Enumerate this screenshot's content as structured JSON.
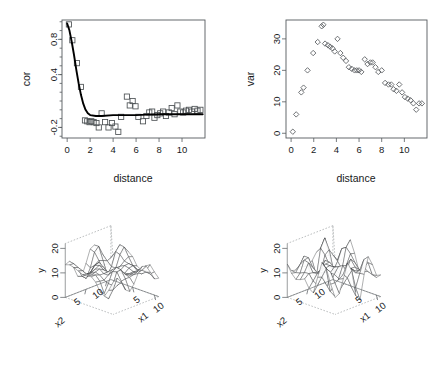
{
  "figure": {
    "layout": "2x2 panel grid",
    "background": "#ffffff",
    "foreground": "#17191b"
  },
  "chart_data": [
    {
      "panel": "top-left",
      "type": "scatter",
      "title": "",
      "xlabel": "distance",
      "ylabel": "cor",
      "xlim": [
        -0.45,
        12.0
      ],
      "ylim": [
        -0.32,
        1.02
      ],
      "xticks": [
        0,
        2,
        4,
        6,
        8,
        10
      ],
      "yticks": [
        -0.2,
        0.4,
        0.8
      ],
      "ytick_labels": [
        "-0.2",
        "0.4",
        "0.8"
      ],
      "grid": false,
      "marker": "open-square",
      "legend": "none",
      "series": [
        {
          "name": "empirical correlation",
          "x": [
            0.15,
            0.45,
            0.85,
            1.2,
            1.55,
            1.75,
            1.95,
            2.1,
            2.3,
            2.55,
            2.75,
            3.0,
            3.3,
            3.6,
            3.9,
            4.2,
            4.45,
            4.7,
            5.2,
            5.45,
            5.7,
            5.95,
            6.2,
            6.6,
            6.9,
            7.15,
            7.4,
            7.6,
            7.85,
            8.1,
            8.35,
            8.6,
            8.85,
            9.1,
            9.35,
            9.6,
            9.85,
            10.1,
            10.35,
            10.6,
            10.85,
            11.1,
            11.35,
            11.6
          ],
          "y": [
            0.97,
            0.79,
            0.53,
            0.26,
            -0.12,
            -0.13,
            -0.14,
            -0.13,
            -0.14,
            -0.15,
            -0.2,
            -0.04,
            -0.14,
            -0.2,
            -0.15,
            -0.19,
            -0.25,
            -0.08,
            0.15,
            0.05,
            0.1,
            0.04,
            -0.08,
            -0.13,
            -0.07,
            -0.03,
            -0.02,
            -0.09,
            -0.06,
            -0.04,
            -0.02,
            -0.07,
            -0.03,
            0.02,
            -0.05,
            0.05,
            -0.02,
            -0.03,
            -0.01,
            0.0,
            -0.02,
            0.01,
            -0.01,
            0.0
          ]
        }
      ],
      "fitted_curve": {
        "name": "fitted exponential decay",
        "style": "solid thick black line",
        "model": "exponential decay to near-zero sill",
        "x": [
          0.0,
          0.2,
          0.4,
          0.6,
          0.8,
          1.0,
          1.2,
          1.4,
          1.6,
          1.8,
          2.0,
          2.5,
          3.0,
          4.0,
          5.0,
          6.0,
          7.0,
          8.0,
          9.0,
          10.0,
          11.0,
          11.8
        ],
        "y": [
          0.98,
          0.9,
          0.77,
          0.62,
          0.45,
          0.3,
          0.17,
          0.07,
          0.0,
          -0.04,
          -0.06,
          -0.07,
          -0.07,
          -0.06,
          -0.06,
          -0.06,
          -0.055,
          -0.05,
          -0.05,
          -0.05,
          -0.05,
          -0.05
        ]
      }
    },
    {
      "panel": "top-right",
      "type": "scatter",
      "title": "",
      "xlabel": "distance",
      "ylabel": "var",
      "xlim": [
        -0.45,
        12.0
      ],
      "ylim": [
        -1.5,
        36.0
      ],
      "xticks": [
        0,
        2,
        4,
        6,
        8,
        10
      ],
      "yticks": [
        0,
        10,
        20,
        30
      ],
      "grid": false,
      "marker": "open-diamond",
      "legend": "none",
      "series": [
        {
          "name": "empirical semivariance",
          "x": [
            0.15,
            0.45,
            0.9,
            1.1,
            1.45,
            1.95,
            2.35,
            2.7,
            2.85,
            3.0,
            3.25,
            3.45,
            3.65,
            3.85,
            4.1,
            4.35,
            4.6,
            4.85,
            5.1,
            5.35,
            5.6,
            5.8,
            6.0,
            6.2,
            6.5,
            6.75,
            7.0,
            7.2,
            7.45,
            7.7,
            8.0,
            8.3,
            8.6,
            8.85,
            9.05,
            9.3,
            9.55,
            9.8,
            10.05,
            10.3,
            10.55,
            10.8,
            11.05,
            11.3,
            11.55
          ],
          "y": [
            0.5,
            6.0,
            13.0,
            14.5,
            20.0,
            25.5,
            29.0,
            34.0,
            34.5,
            28.5,
            28.0,
            27.5,
            27.0,
            26.0,
            30.0,
            25.5,
            24.0,
            23.0,
            21.0,
            20.5,
            20.0,
            20.0,
            20.0,
            19.5,
            23.5,
            22.0,
            22.5,
            22.5,
            21.0,
            19.5,
            20.0,
            16.0,
            15.5,
            15.5,
            14.0,
            13.5,
            15.5,
            13.0,
            11.5,
            11.0,
            10.5,
            9.5,
            7.5,
            9.5,
            9.5
          ]
        }
      ]
    },
    {
      "panel": "bottom-left",
      "type": "surface",
      "title": "",
      "xlabel": "x1",
      "ylabel": "x2",
      "zlabel": "y",
      "xticks": [
        5,
        10
      ],
      "yticks": [
        5,
        10
      ],
      "zticks": [
        0,
        10,
        20
      ],
      "zlim": [
        0,
        22
      ],
      "style": "wireframe mesh, perspective box with dashed guide edges",
      "description": "smooth undulating random field surface with moderate peak amplitude"
    },
    {
      "panel": "bottom-right",
      "type": "surface",
      "title": "",
      "xlabel": "x1",
      "ylabel": "x2",
      "zlabel": "y",
      "xticks": [
        5,
        10
      ],
      "yticks": [
        5,
        10
      ],
      "zticks": [
        0,
        10,
        20
      ],
      "zlim": [
        0,
        22
      ],
      "style": "wireframe mesh, perspective box with dashed guide edges",
      "description": "undulating random field surface with sharper, taller peaks than left panel"
    }
  ],
  "panels": {
    "cor": {
      "xlabel": "distance",
      "ylabel": "cor",
      "xticks": [
        "0",
        "2",
        "4",
        "6",
        "8",
        "10"
      ],
      "yticks": [
        "-0.2",
        "0.4",
        "0.8"
      ]
    },
    "var": {
      "xlabel": "distance",
      "ylabel": "var",
      "xticks": [
        "0",
        "2",
        "4",
        "6",
        "8",
        "10"
      ],
      "yticks": [
        "0",
        "10",
        "20",
        "30"
      ]
    },
    "surf1": {
      "xlabel": "x1",
      "ylabel": "x2",
      "zlabel": "y",
      "xticks": [
        "5",
        "10"
      ],
      "yticks": [
        "5",
        "10"
      ],
      "zticks": [
        "0",
        "10",
        "20"
      ]
    },
    "surf2": {
      "xlabel": "x1",
      "ylabel": "x2",
      "zlabel": "y",
      "xticks": [
        "5",
        "10"
      ],
      "yticks": [
        "5",
        "10"
      ],
      "zticks": [
        "0",
        "10",
        "20"
      ]
    }
  }
}
